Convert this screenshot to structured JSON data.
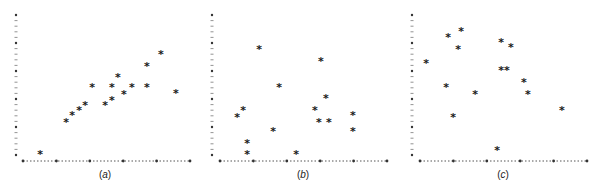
{
  "figure": {
    "style": {
      "marker_color": "#1a1a1a",
      "axis_color": "#555555",
      "background": "#ffffff"
    }
  },
  "chart_data": [
    {
      "type": "scatter",
      "panel_label": "(a)",
      "label_letter": "a",
      "title": "",
      "xlabel": "",
      "ylabel": "",
      "xlim": [
        0,
        5
      ],
      "ylim": [
        0,
        5
      ],
      "x_major_ticks": 5,
      "y_major_ticks": 5,
      "minor_per_major": 5,
      "grid": false,
      "marker": "*",
      "tick_labels": false,
      "points": [
        [
          0.51,
          0.04
        ],
        [
          1.29,
          1.21
        ],
        [
          1.47,
          1.43
        ],
        [
          1.68,
          1.61
        ],
        [
          1.86,
          1.82
        ],
        [
          2.07,
          2.43
        ],
        [
          2.46,
          1.82
        ],
        [
          2.66,
          2.0
        ],
        [
          2.66,
          2.43
        ],
        [
          2.84,
          2.82
        ],
        [
          3.02,
          2.21
        ],
        [
          3.26,
          2.43
        ],
        [
          3.71,
          3.21
        ],
        [
          3.71,
          2.43
        ],
        [
          4.13,
          3.64
        ],
        [
          4.58,
          2.25
        ]
      ]
    },
    {
      "type": "scatter",
      "panel_label": "(b)",
      "label_letter": "b",
      "title": "",
      "xlabel": "",
      "ylabel": "",
      "xlim": [
        0,
        5
      ],
      "ylim": [
        0,
        5
      ],
      "x_major_ticks": 5,
      "y_major_ticks": 5,
      "minor_per_major": 5,
      "grid": false,
      "marker": "*",
      "tick_labels": false,
      "points": [
        [
          0.51,
          1.39
        ],
        [
          0.69,
          1.61
        ],
        [
          0.81,
          0.43
        ],
        [
          0.81,
          0.04
        ],
        [
          1.17,
          3.82
        ],
        [
          1.59,
          0.86
        ],
        [
          1.77,
          2.43
        ],
        [
          2.28,
          0.04
        ],
        [
          2.84,
          1.61
        ],
        [
          2.96,
          1.18
        ],
        [
          3.02,
          3.39
        ],
        [
          3.17,
          2.04
        ],
        [
          3.26,
          1.18
        ],
        [
          3.98,
          1.43
        ],
        [
          3.98,
          0.86
        ]
      ]
    },
    {
      "type": "scatter",
      "panel_label": "(c)",
      "label_letter": "c",
      "title": "",
      "xlabel": "",
      "ylabel": "",
      "xlim": [
        0,
        5
      ],
      "ylim": [
        0,
        5
      ],
      "x_major_ticks": 5,
      "y_major_ticks": 5,
      "minor_per_major": 5,
      "grid": false,
      "marker": "*",
      "tick_labels": false,
      "points": [
        [
          0.18,
          3.29
        ],
        [
          0.78,
          2.43
        ],
        [
          0.84,
          4.25
        ],
        [
          0.99,
          1.39
        ],
        [
          1.14,
          3.79
        ],
        [
          1.23,
          4.46
        ],
        [
          1.65,
          2.21
        ],
        [
          2.31,
          0.21
        ],
        [
          2.43,
          4.07
        ],
        [
          2.43,
          3.07
        ],
        [
          2.6,
          3.07
        ],
        [
          2.72,
          3.86
        ],
        [
          3.11,
          2.61
        ],
        [
          3.23,
          2.21
        ],
        [
          4.25,
          1.64
        ]
      ]
    }
  ]
}
